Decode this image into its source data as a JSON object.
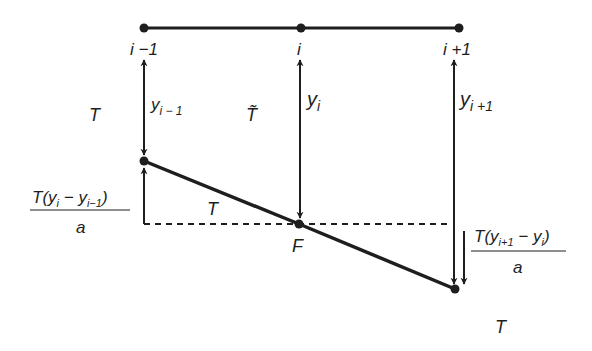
{
  "diagram": {
    "title": "",
    "colors": {
      "ink": "#1e1e1e",
      "background": "#ffffff"
    },
    "nodes": {
      "top": [
        {
          "id": "top-i-1",
          "label": "i −1"
        },
        {
          "id": "top-i",
          "label": "i"
        },
        {
          "id": "top-i+1",
          "label": "i +1"
        }
      ],
      "string": [
        {
          "id": "node-i-1"
        },
        {
          "id": "node-F",
          "label": "F"
        },
        {
          "id": "node-i+1"
        }
      ]
    },
    "displacements": [
      {
        "symbol": "y",
        "sub": "i − 1"
      },
      {
        "symbol": "y",
        "sub": "i"
      },
      {
        "symbol": "y",
        "sub": "i +1"
      }
    ],
    "tension_labels": {
      "left": "T",
      "top_middle": "T̃",
      "segment": "T",
      "bottom_right": "T"
    },
    "force_left": {
      "numerator_prefix": "T(",
      "y1": "y",
      "sub1": "i",
      "minus": " − ",
      "y2": "y",
      "sub2": "i−1",
      "close": ")",
      "denominator": "a"
    },
    "force_right": {
      "numerator_prefix": "T(",
      "y1": "y",
      "sub1": "i+1",
      "minus": " − ",
      "y2": "y",
      "sub2": "i",
      "close": ")",
      "denominator": "a"
    }
  }
}
